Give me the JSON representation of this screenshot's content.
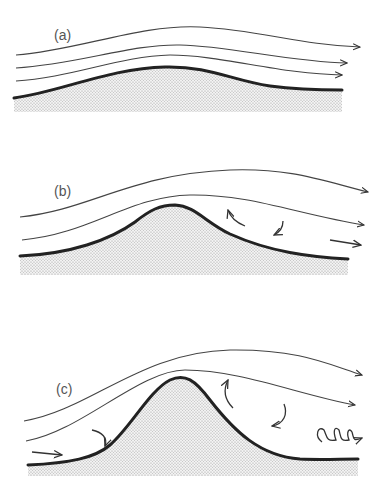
{
  "panels": [
    {
      "id": "a",
      "label": "(a)",
      "description": "Smooth flow over a gentle hill; streamlines follow terrain"
    },
    {
      "id": "b",
      "label": "(b)",
      "description": "Flow over moderate hill with small lee-side eddies"
    },
    {
      "id": "c",
      "label": "(c)",
      "description": "Flow over steep hill with separation, recirculation and turbulent eddies in the lee"
    }
  ],
  "colors": {
    "line": "#333333",
    "ground_fill": "#d8d8d8",
    "label": "#555555"
  }
}
